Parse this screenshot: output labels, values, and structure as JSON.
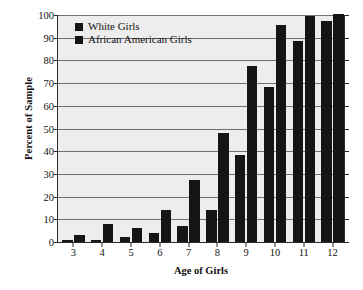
{
  "chart_data": {
    "type": "bar",
    "title": "",
    "xlabel": "Age of Girls",
    "ylabel": "Percent of Sample",
    "categories": [
      "3",
      "4",
      "5",
      "6",
      "7",
      "8",
      "9",
      "10",
      "11",
      "12"
    ],
    "series": [
      {
        "name": "White Girls",
        "color": "#151515",
        "values": [
          1,
          1,
          2,
          4,
          7,
          14,
          38,
          68,
          88,
          97
        ]
      },
      {
        "name": "African American Girls",
        "color": "#151515",
        "values": [
          3,
          8,
          6,
          14,
          27,
          48,
          77,
          95,
          99,
          100
        ]
      }
    ],
    "ylim": [
      0,
      100
    ],
    "yticks": [
      0,
      10,
      20,
      30,
      40,
      50,
      60,
      70,
      80,
      90,
      100
    ],
    "ytick_labels": [
      "0",
      "10",
      "20",
      "30",
      "40",
      "50",
      "60",
      "70",
      "80",
      "90",
      "100"
    ],
    "grid": true,
    "grid_axis": "y",
    "legend_position": "upper-left-inside",
    "plot_background": "#ededed",
    "axis_color": "#2b2b2b",
    "gridline_color": "#6f6f6f"
  },
  "legend": {
    "items": [
      {
        "label": "White Girls",
        "swatch": "legend-swatch-white-girls"
      },
      {
        "label": "African American Girls",
        "swatch": "legend-swatch-african-american-girls"
      }
    ]
  }
}
